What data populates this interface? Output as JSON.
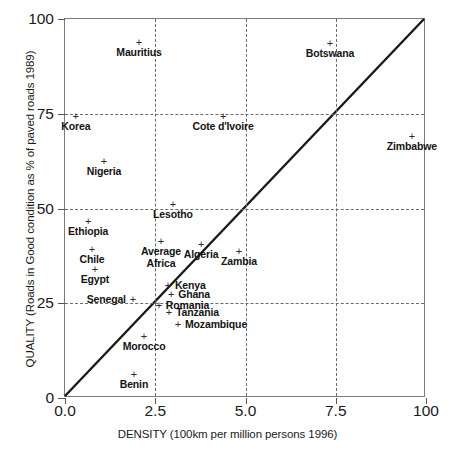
{
  "chart_data": {
    "type": "scatter",
    "title": "",
    "xlabel": "DENSITY (100km per million persons 1996)",
    "ylabel": "QUALITY (Roads in Good condition as % of paved roads 1989)",
    "xlim": [
      0,
      10
    ],
    "ylim": [
      0,
      100
    ],
    "grid": true,
    "legend": "none",
    "xticks": [
      {
        "value": 0,
        "label": "0.0"
      },
      {
        "value": 2.5,
        "label": "2.5"
      },
      {
        "value": 5,
        "label": "5.0"
      },
      {
        "value": 7.5,
        "label": "7.5"
      },
      {
        "value": 10,
        "label": "100"
      }
    ],
    "yticks": [
      {
        "value": 0,
        "label": "0"
      },
      {
        "value": 25,
        "label": "25"
      },
      {
        "value": 50,
        "label": "50"
      },
      {
        "value": 75,
        "label": "75"
      },
      {
        "value": 100,
        "label": "100"
      }
    ],
    "gridlines": {
      "x": [
        2.5,
        5,
        7.5
      ],
      "y": [
        25,
        50,
        75
      ]
    },
    "reference_line": {
      "description": "45-degree diagonal from origin to top-right corner",
      "from": [
        0,
        0
      ],
      "to": [
        10,
        100
      ],
      "style": "solid",
      "color": "#1a1a1a"
    },
    "marker_symbol": "+",
    "points": [
      {
        "label": "Mauritius",
        "x": 2.05,
        "y": 94.0,
        "label_pos": "below"
      },
      {
        "label": "Botswana",
        "x": 7.34,
        "y": 93.7,
        "label_pos": "below"
      },
      {
        "label": "Korea",
        "x": 0.3,
        "y": 74.5,
        "label_pos": "below"
      },
      {
        "label": "Cote d'Ivoire",
        "x": 4.38,
        "y": 74.5,
        "label_pos": "below"
      },
      {
        "label": "Zimbabwe",
        "x": 9.61,
        "y": 69.0,
        "label_pos": "below"
      },
      {
        "label": "Nigeria",
        "x": 1.08,
        "y": 62.5,
        "label_pos": "below"
      },
      {
        "label": "Lesotho",
        "x": 2.99,
        "y": 51.2,
        "label_pos": "below"
      },
      {
        "label": "Ethiopia",
        "x": 0.64,
        "y": 46.7,
        "label_pos": "below"
      },
      {
        "label": "Average Africa",
        "x": 2.66,
        "y": 41.4,
        "label_pos": "below2"
      },
      {
        "label": "Algeria",
        "x": 3.77,
        "y": 40.6,
        "label_pos": "below"
      },
      {
        "label": "Chile",
        "x": 0.75,
        "y": 39.3,
        "label_pos": "below"
      },
      {
        "label": "Zambia",
        "x": 4.82,
        "y": 38.8,
        "label_pos": "below"
      },
      {
        "label": "Egypt",
        "x": 0.83,
        "y": 34.0,
        "label_pos": "below"
      },
      {
        "label": "Kenya",
        "x": 2.85,
        "y": 29.8,
        "label_pos": "right"
      },
      {
        "label": "Ghana",
        "x": 2.94,
        "y": 27.4,
        "label_pos": "right"
      },
      {
        "label": "Senegal",
        "x": 1.88,
        "y": 26.1,
        "label_pos": "left"
      },
      {
        "label": "Romania",
        "x": 2.6,
        "y": 24.5,
        "label_pos": "right"
      },
      {
        "label": "Tanzania",
        "x": 2.88,
        "y": 22.7,
        "label_pos": "right"
      },
      {
        "label": "Mozambique",
        "x": 3.13,
        "y": 19.5,
        "label_pos": "right"
      },
      {
        "label": "Morocco",
        "x": 2.19,
        "y": 16.4,
        "label_pos": "below"
      },
      {
        "label": "Benin",
        "x": 1.91,
        "y": 6.3,
        "label_pos": "below"
      }
    ]
  }
}
